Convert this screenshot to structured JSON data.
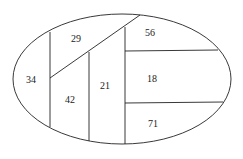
{
  "diagram": {
    "shape": "ellipse",
    "line_color": "#222222",
    "regions": [
      {
        "id": "r1",
        "label": "29"
      },
      {
        "id": "r2",
        "label": "34"
      },
      {
        "id": "r3",
        "label": "42"
      },
      {
        "id": "r4",
        "label": "21"
      },
      {
        "id": "r5",
        "label": "56"
      },
      {
        "id": "r6",
        "label": "18"
      },
      {
        "id": "r7",
        "label": "71"
      }
    ]
  }
}
